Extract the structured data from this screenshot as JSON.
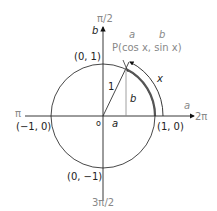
{
  "diagram": {
    "type": "unit-circle",
    "axes": {
      "vertical_top_angle": "π/2",
      "vertical_label": "b",
      "horizontal_right_angle": "2π",
      "horizontal_label": "a",
      "left_angle": "π",
      "bottom_angle": "3π/2",
      "origin": "o"
    },
    "points": {
      "top": "(0, 1)",
      "left": "(−1, 0)",
      "right": "(1, 0)",
      "bottom": "(0, −1)"
    },
    "point_p": {
      "label": "P(cos x, sin x)",
      "a_label": "a",
      "b_label": "b"
    },
    "radius_label": "1",
    "height_label": "b",
    "base_label": "a",
    "arc_label": "x"
  }
}
